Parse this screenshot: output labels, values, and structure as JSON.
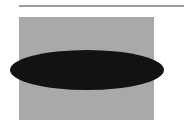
{
  "figure": {
    "background": "#ffffff",
    "shapes": [
      {
        "type": "line",
        "name": "top-rule",
        "x1": 19,
        "y1": 6,
        "x2": 184,
        "y2": 6,
        "stroke": "#7a7a7a",
        "stroke_width": 1.3
      },
      {
        "type": "rect",
        "name": "gray-rectangle",
        "x": 19,
        "y": 17,
        "width": 135,
        "height": 103,
        "fill": "#a9a9a9"
      },
      {
        "type": "ellipse",
        "name": "black-ellipse",
        "cx": 87,
        "cy": 70,
        "rx": 77,
        "ry": 20,
        "fill": "#121212"
      }
    ]
  }
}
